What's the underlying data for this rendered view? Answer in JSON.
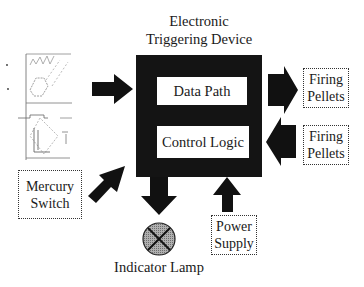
{
  "diagram": {
    "title_line1": "Electronic",
    "title_line2": "Triggering Device",
    "device": {
      "blocks": [
        {
          "id": "data_path",
          "label": "Data Path"
        },
        {
          "id": "control_logic",
          "label": "Control Logic"
        }
      ]
    },
    "outputs": {
      "firing_pellets_top": {
        "line1": "Firing",
        "line2": "Pellets"
      },
      "firing_pellets_bottom": {
        "line1": "Firing",
        "line2": "Pellets"
      }
    },
    "inputs": {
      "mercury_switch": {
        "line1": "Mercury",
        "line2": "Switch"
      },
      "power_supply": {
        "line1": "Power",
        "line2": "Supply"
      },
      "waveform_image": {
        "icon": "waveform-plot-icon"
      }
    },
    "indicator": {
      "label": "Indicator Lamp",
      "icon": "lamp-x-circle-icon"
    },
    "connections": [
      {
        "from": "waveform_image",
        "to": "device",
        "direction": "right"
      },
      {
        "from": "device",
        "to": "firing_pellets_top",
        "direction": "right"
      },
      {
        "from": "firing_pellets_bottom",
        "to": "device",
        "direction": "left"
      },
      {
        "from": "mercury_switch",
        "to": "device",
        "direction": "up-right"
      },
      {
        "from": "device",
        "to": "indicator_lamp",
        "direction": "down"
      },
      {
        "from": "power_supply",
        "to": "device",
        "direction": "up"
      }
    ],
    "colors": {
      "device_fill": "#141414",
      "arrow_fill": "#111111",
      "lamp_fill": "#9a9a9a",
      "box_border": "#333333",
      "background": "#ffffff"
    }
  }
}
